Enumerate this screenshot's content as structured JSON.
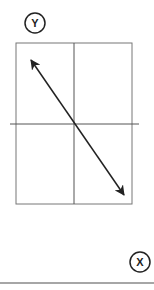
{
  "diagram": {
    "y_axis_label": "Y",
    "x_axis_label": "X",
    "colors": {
      "line": "#222222",
      "frame": "#777777",
      "baseline": "#888888",
      "background": "#ffffff"
    },
    "frame": {
      "x": 16,
      "y": 43,
      "width": 116,
      "height": 161
    },
    "vertical_center_line_x": 74,
    "horizontal_line": {
      "y": 124,
      "x1": 10,
      "x2": 139
    },
    "double_arrow": {
      "x1": 31,
      "y1": 60,
      "x2": 124,
      "y2": 195
    },
    "baseline_y": 283
  }
}
